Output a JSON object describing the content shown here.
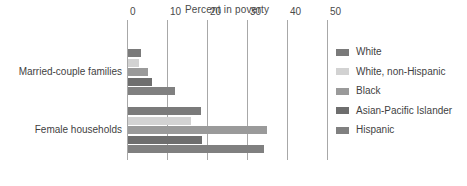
{
  "chart_data": {
    "type": "bar",
    "orientation": "horizontal",
    "title": "Percent in poverty",
    "xlabel": "",
    "ylabel": "",
    "xlim": [
      0,
      50
    ],
    "xticks": [
      0,
      10,
      20,
      30,
      40,
      50
    ],
    "xtick_labels": [
      "0",
      "10",
      "20",
      "30",
      "40",
      "50"
    ],
    "grid": true,
    "legend_position": "right",
    "categories": [
      "Married-couple families",
      "Female households"
    ],
    "series": [
      {
        "name": "White",
        "color": "#7a7a7a",
        "values": [
          3.2,
          18.2
        ]
      },
      {
        "name": "White, non-Hispanic",
        "color": "#d2d2d2",
        "values": [
          2.7,
          15.7
        ]
      },
      {
        "name": "Black",
        "color": "#9a9a9a",
        "values": [
          5.0,
          34.7
        ]
      },
      {
        "name": "Asian-Pacific Islander",
        "color": "#6e6e6e",
        "values": [
          6.0,
          18.5
        ]
      },
      {
        "name": "Hispanic",
        "color": "#808080",
        "values": [
          11.7,
          34.0
        ]
      }
    ]
  },
  "axis": {
    "grid_color": "#a8a8a8",
    "tick_text_color": "#4a4a4a"
  }
}
